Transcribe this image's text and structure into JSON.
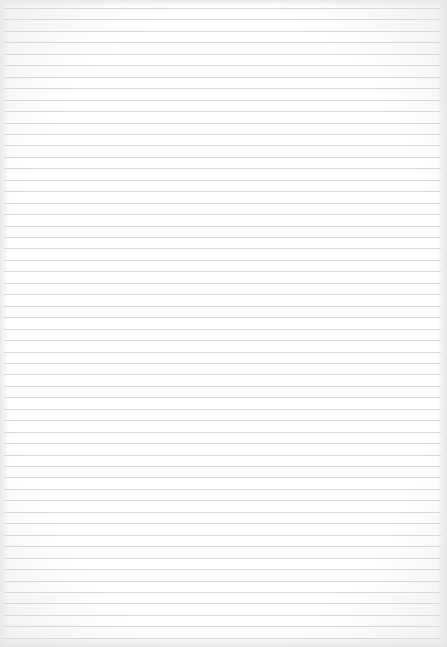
{
  "paper": {
    "type": "lined-paper",
    "line_count": 56,
    "first_line_y": 8,
    "line_spacing": 11.45,
    "line_color": "#d9d9d9",
    "background_color": "#ffffff"
  }
}
